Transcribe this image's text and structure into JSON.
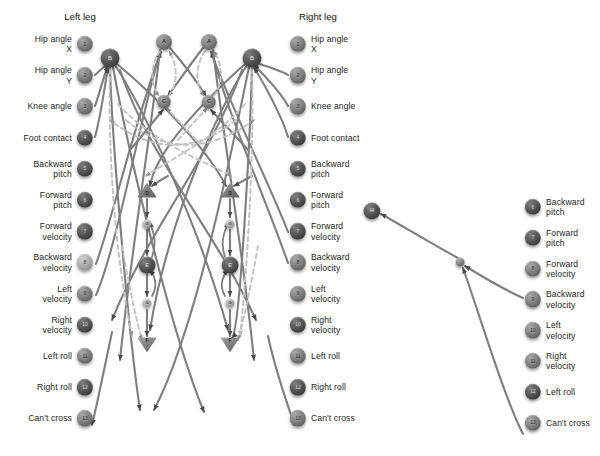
{
  "figure": {
    "background": "#ffffff",
    "edge_color": "#7f7f7f",
    "dashed_edge_color": "#bdbdbd"
  },
  "headings": [
    {
      "id": "left-leg-heading",
      "text": "Left leg",
      "x": 80,
      "y": 16
    },
    {
      "id": "right-leg-heading",
      "text": "Right leg",
      "x": 318,
      "y": 16
    }
  ],
  "columns": {
    "left_leg": {
      "name": "Left leg inputs",
      "node_x": 85,
      "label_side": "left",
      "label_x": 72,
      "start_y": 44,
      "spacing": 31.2,
      "nodes": [
        {
          "num": "1",
          "label": "Hip angle\nX",
          "tone": "mid"
        },
        {
          "num": "2",
          "label": "Hip angle\nY",
          "tone": "mid"
        },
        {
          "num": "3",
          "label": "Knee angle",
          "tone": "mid"
        },
        {
          "num": "4",
          "label": "Foot contact",
          "tone": "dark"
        },
        {
          "num": "5",
          "label": "Backward\npitch",
          "tone": "dark"
        },
        {
          "num": "6",
          "label": "Forward\npitch",
          "tone": "dark"
        },
        {
          "num": "7",
          "label": "Forward\nvelocity",
          "tone": "dark"
        },
        {
          "num": "8",
          "label": "Backward\nvelocity",
          "tone": "light"
        },
        {
          "num": "9",
          "label": "Left\nvelocity",
          "tone": "mid"
        },
        {
          "num": "10",
          "label": "Right\nvelocity",
          "tone": "dark"
        },
        {
          "num": "11",
          "label": "Left roll",
          "tone": "mid"
        },
        {
          "num": "12",
          "label": "Right roll",
          "tone": "dark"
        },
        {
          "num": "13",
          "label": "Can't cross",
          "tone": "mid"
        }
      ]
    },
    "right_leg": {
      "name": "Right leg inputs",
      "node_x": 298,
      "label_side": "right",
      "label_x": 311,
      "start_y": 44,
      "spacing": 31.2,
      "nodes": [
        {
          "num": "1",
          "label": "Hip angle\nX",
          "tone": "mid"
        },
        {
          "num": "2",
          "label": "Hip angle\nY",
          "tone": "mid"
        },
        {
          "num": "3",
          "label": "Knee angle",
          "tone": "mid"
        },
        {
          "num": "4",
          "label": "Foot contact",
          "tone": "dark"
        },
        {
          "num": "5",
          "label": "Backward\npitch",
          "tone": "dark"
        },
        {
          "num": "6",
          "label": "Forward\npitch",
          "tone": "dark"
        },
        {
          "num": "7",
          "label": "Forward\nvelocity",
          "tone": "dark"
        },
        {
          "num": "8",
          "label": "Backward\nvelocity",
          "tone": "mid"
        },
        {
          "num": "9",
          "label": "Left\nvelocity",
          "tone": "mid"
        },
        {
          "num": "10",
          "label": "Right\nvelocity",
          "tone": "dark"
        },
        {
          "num": "11",
          "label": "Left roll",
          "tone": "mid"
        },
        {
          "num": "12",
          "label": "Right roll",
          "tone": "dark"
        },
        {
          "num": "13",
          "label": "Can't cross",
          "tone": "mid"
        }
      ]
    },
    "far_right": {
      "name": "Far right inputs",
      "node_x": 533,
      "label_side": "right",
      "label_x": 546,
      "start_y": 207,
      "spacing": 30.8,
      "nodes": [
        {
          "num": "6",
          "label": "Backward\npitch",
          "tone": "dark"
        },
        {
          "num": "7",
          "label": "Forward\npitch",
          "tone": "dark"
        },
        {
          "num": "8",
          "label": "Forward\nvelocity",
          "tone": "mid"
        },
        {
          "num": "9",
          "label": "Backward\nvelocity",
          "tone": "mid"
        },
        {
          "num": "10",
          "label": "Left\nvelocity",
          "tone": "mid"
        },
        {
          "num": "11",
          "label": "Right\nvelocity",
          "tone": "mid"
        },
        {
          "num": "12",
          "label": "Left roll",
          "tone": "dark"
        },
        {
          "num": "13",
          "label": "Can't cross",
          "tone": "mid"
        }
      ]
    }
  },
  "hidden_nodes": [
    {
      "id": "bL",
      "letter": "B",
      "x": 110,
      "y": 58,
      "r": 9.5,
      "tone": "dark",
      "shape": "circle"
    },
    {
      "id": "bR",
      "letter": "B",
      "x": 252,
      "y": 58,
      "r": 9.5,
      "tone": "dark",
      "shape": "circle"
    },
    {
      "id": "a1",
      "letter": "A",
      "x": 164,
      "y": 42,
      "r": 8.0,
      "tone": "mid",
      "shape": "circle"
    },
    {
      "id": "a2",
      "letter": "A",
      "x": 209,
      "y": 42,
      "r": 8.0,
      "tone": "mid",
      "shape": "circle"
    },
    {
      "id": "c1",
      "letter": "C",
      "x": 164,
      "y": 102,
      "r": 7.2,
      "tone": "mid",
      "shape": "circle"
    },
    {
      "id": "c2",
      "letter": "C",
      "x": 209,
      "y": 102,
      "r": 7.2,
      "tone": "mid",
      "shape": "circle"
    },
    {
      "id": "d1",
      "letter": "D",
      "x": 147,
      "y": 190,
      "r": 9.0,
      "tone": "mid",
      "shape": "triangle-up"
    },
    {
      "id": "d2",
      "letter": "D",
      "x": 230,
      "y": 190,
      "r": 9.0,
      "tone": "mid",
      "shape": "triangle-up"
    },
    {
      "id": "g1",
      "letter": "G",
      "x": 147,
      "y": 224,
      "r": 4.6,
      "tone": "light",
      "shape": "circle"
    },
    {
      "id": "g2",
      "letter": "G",
      "x": 230,
      "y": 224,
      "r": 4.6,
      "tone": "light",
      "shape": "circle"
    },
    {
      "id": "e1",
      "letter": "E",
      "x": 147,
      "y": 265,
      "r": 8.4,
      "tone": "dark",
      "shape": "circle"
    },
    {
      "id": "e2",
      "letter": "E",
      "x": 230,
      "y": 265,
      "r": 8.4,
      "tone": "dark",
      "shape": "circle"
    },
    {
      "id": "g3",
      "letter": "G",
      "x": 147,
      "y": 303,
      "r": 4.6,
      "tone": "light",
      "shape": "circle"
    },
    {
      "id": "g4",
      "letter": "G",
      "x": 230,
      "y": 303,
      "r": 4.6,
      "tone": "light",
      "shape": "circle"
    },
    {
      "id": "f1",
      "letter": "F",
      "x": 147,
      "y": 345,
      "r": 9.0,
      "tone": "mid",
      "shape": "triangle-down"
    },
    {
      "id": "f2",
      "letter": "F",
      "x": 230,
      "y": 345,
      "r": 9.0,
      "tone": "mid",
      "shape": "triangle-down"
    },
    {
      "id": "h1",
      "letter": "H",
      "x": 372,
      "y": 211,
      "r": 8.6,
      "tone": "dark",
      "shape": "circle"
    },
    {
      "id": "j1",
      "letter": "",
      "x": 460,
      "y": 262,
      "r": 4.4,
      "tone": "mid",
      "shape": "circle"
    }
  ],
  "edges": {
    "solid_count": 48,
    "dashed_count": 14,
    "arrowheads": true,
    "style": "curved"
  }
}
